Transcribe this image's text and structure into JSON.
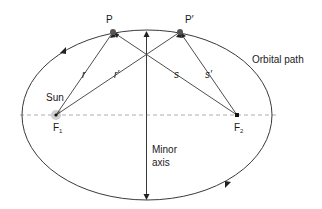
{
  "diagram": {
    "type": "elliptical-orbit",
    "colors": {
      "line": "#3a3a3a",
      "dashed": "#9a9a9a",
      "focus_halo": "#cfcfcf",
      "text": "#1a1a1a"
    },
    "labels": {
      "point_p": "P",
      "point_p_prime": "P′",
      "dist_r": "r",
      "dist_r_prime": "r′",
      "dist_s": "s",
      "dist_s_prime": "s′",
      "sun": "Sun",
      "focus1": "F",
      "focus1_sub": "1",
      "focus2": "F",
      "focus2_sub": "2",
      "orbital_path": "Orbital path",
      "minor_axis_line1": "Minor",
      "minor_axis_line2": "axis"
    }
  }
}
